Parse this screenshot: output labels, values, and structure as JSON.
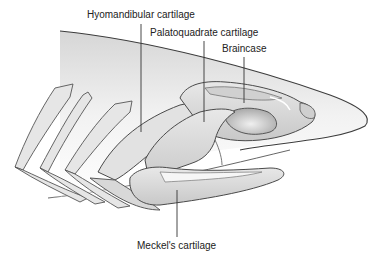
{
  "diagram": {
    "labels": {
      "hyomandibular": "Hyomandibular cartilage",
      "palatoquadrate": "Palatoquadrate cartilage",
      "braincase": "Braincase",
      "meckels": "Meckel's cartilage"
    },
    "colors": {
      "outline": "#4a4a4a",
      "cartilage_fill": "#e4e4e4",
      "cartilage_shade": "#c9c9c9",
      "head_fill": "#ececec",
      "leader_line": "#333333",
      "text": "#222222"
    }
  }
}
